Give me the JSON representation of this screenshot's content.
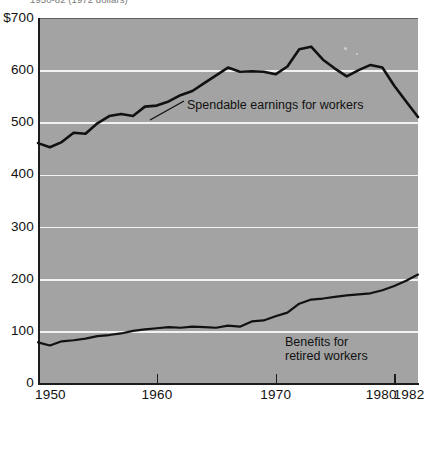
{
  "title": "1950-82  (1972 dollars)",
  "axes": {
    "y_ticks": [
      "$700",
      "600",
      "500",
      "400",
      "300",
      "200",
      "100",
      "0"
    ],
    "y_values": [
      700,
      600,
      500,
      400,
      300,
      200,
      100,
      0
    ],
    "x_ticks": [
      "1950",
      "1960",
      "1970",
      "1980",
      "1982"
    ],
    "x_values": [
      1950,
      1960,
      1970,
      1980,
      1982
    ]
  },
  "labels": {
    "spendable": "Spendable earnings for workers",
    "benefits": "Benefits for\nretired workers"
  },
  "colors": {
    "plot_background": "#a3a3a3",
    "gridline": "#f2f2f2",
    "line": "#111111",
    "axis": "#1c1c1c",
    "page_background": "#ffffff"
  },
  "chart_data": {
    "type": "line",
    "title": "1950-82  (1972 dollars)",
    "xlabel": "",
    "ylabel": "",
    "xlim": [
      1950,
      1982
    ],
    "ylim": [
      0,
      700
    ],
    "grid": true,
    "legend": "inline-annotations",
    "x": [
      1950,
      1951,
      1952,
      1953,
      1954,
      1955,
      1956,
      1957,
      1958,
      1959,
      1960,
      1961,
      1962,
      1963,
      1964,
      1965,
      1966,
      1967,
      1968,
      1969,
      1970,
      1971,
      1972,
      1973,
      1974,
      1975,
      1976,
      1977,
      1978,
      1979,
      1980,
      1981,
      1982
    ],
    "series": [
      {
        "name": "Spendable earnings for workers",
        "values": [
          460,
          452,
          462,
          480,
          478,
          498,
          512,
          516,
          512,
          530,
          532,
          540,
          552,
          560,
          575,
          590,
          605,
          597,
          598,
          597,
          592,
          607,
          640,
          645,
          620,
          603,
          588,
          600,
          610,
          605,
          570,
          540,
          510
        ]
      },
      {
        "name": "Benefits for retired workers",
        "values": [
          78,
          72,
          80,
          82,
          85,
          90,
          92,
          95,
          100,
          103,
          105,
          107,
          106,
          108,
          107,
          106,
          110,
          108,
          118,
          120,
          128,
          135,
          152,
          160,
          162,
          165,
          168,
          170,
          172,
          178,
          186,
          196,
          208
        ]
      }
    ]
  }
}
